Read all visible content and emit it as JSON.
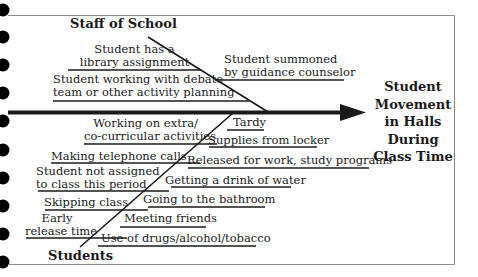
{
  "diagram": {
    "type": "fishbone",
    "effect": {
      "lines": [
        "Student",
        "Movement",
        "in Halls",
        "During",
        "Class Time"
      ]
    },
    "categories": {
      "staff": {
        "label": "Staff of School",
        "causes": [
          {
            "lines": [
              "Student has a",
              "library assignment"
            ]
          },
          {
            "lines": [
              "Student summoned",
              "by guidance counselor"
            ]
          },
          {
            "lines": [
              "Student working with debate",
              "team or other activity planning"
            ]
          }
        ]
      },
      "students": {
        "label": "Students",
        "causes_left": [
          {
            "lines": [
              "Working on extra/",
              "co-curricular activities"
            ]
          },
          {
            "lines": [
              "Making telephone calls"
            ]
          },
          {
            "lines": [
              "Student not assigned",
              "to class this period"
            ]
          },
          {
            "lines": [
              "Skipping class"
            ]
          },
          {
            "lines": [
              "Early",
              "release time"
            ]
          }
        ],
        "causes_right": [
          {
            "lines": [
              "Tardy"
            ]
          },
          {
            "lines": [
              "Supplies from locker"
            ]
          },
          {
            "lines": [
              "Released for work, study programs"
            ]
          },
          {
            "lines": [
              "Getting a drink of water"
            ]
          },
          {
            "lines": [
              "Going to the bathroom"
            ]
          },
          {
            "lines": [
              "Meeting friends"
            ]
          },
          {
            "lines": [
              "Use of drugs/alcohol/tobacco"
            ]
          }
        ]
      }
    },
    "colors": {
      "line": "#1a1a1a",
      "border": "#8a8a8a",
      "binder_hole": "#000000"
    }
  }
}
